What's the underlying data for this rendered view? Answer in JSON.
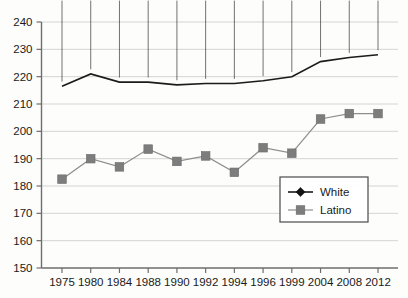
{
  "chart_data": {
    "type": "line",
    "title": "",
    "subtitle": "",
    "xlabel": "",
    "ylabel": "",
    "categories": [
      "1975",
      "1980",
      "1984",
      "1988",
      "1990",
      "1992",
      "1994",
      "1996",
      "1999",
      "2004",
      "2008",
      "2012"
    ],
    "ylim": [
      150,
      240
    ],
    "ytick_step": 10,
    "yticks": [
      "150",
      "160",
      "170",
      "180",
      "190",
      "200",
      "210",
      "220",
      "230",
      "240"
    ],
    "grid": true,
    "grid_axis": "y",
    "legend_position": "bottom-right",
    "series": [
      {
        "name": "White",
        "marker": "diamond",
        "color": "#141414",
        "values": [
          216.5,
          221.0,
          218.0,
          218.0,
          217.0,
          217.5,
          217.5,
          218.5,
          220.0,
          225.5,
          227.0,
          228.0
        ]
      },
      {
        "name": "Latino",
        "marker": "square",
        "color": "#7d7d7d",
        "values": [
          182.5,
          190.0,
          187.0,
          193.5,
          189.0,
          191.0,
          185.0,
          194.0,
          192.0,
          204.5,
          206.5,
          206.5
        ]
      }
    ]
  },
  "legend": {
    "entries": [
      {
        "label": "White"
      },
      {
        "label": "Latino"
      }
    ]
  }
}
